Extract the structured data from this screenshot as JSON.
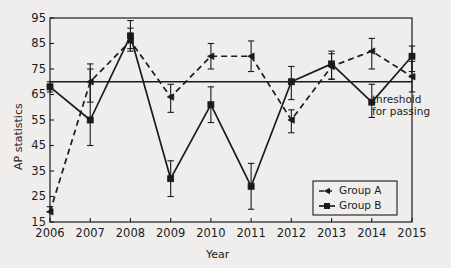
{
  "chart_data": {
    "type": "line",
    "title": "",
    "xlabel": "Year",
    "ylabel": "AP statistics",
    "x": [
      2006,
      2007,
      2008,
      2009,
      2010,
      2011,
      2012,
      2013,
      2014,
      2015
    ],
    "xtick_labels": [
      "2006",
      "2007",
      "2008",
      "2009",
      "2010",
      "2011",
      "2012",
      "2013",
      "2014",
      "2015"
    ],
    "ytick_labels": [
      "15",
      "25",
      "35",
      "45",
      "55",
      "65",
      "75",
      "85",
      "95"
    ],
    "yticks": [
      15,
      25,
      35,
      45,
      55,
      65,
      75,
      85,
      95
    ],
    "ylim": [
      15,
      95
    ],
    "xlim": [
      2006,
      2015
    ],
    "grid": false,
    "legend_position": "lower right",
    "series": [
      {
        "name": "Group A",
        "style": "dashed",
        "marker": "triangle",
        "color": "#1b1b1b",
        "values": [
          19,
          70,
          86,
          64,
          80,
          80,
          55,
          76,
          82,
          72
        ],
        "err_low": [
          19,
          62,
          82,
          58,
          75,
          74,
          50,
          71,
          75,
          66
        ],
        "err_high": [
          21,
          77,
          91,
          69,
          85,
          86,
          59,
          81,
          87,
          78
        ]
      },
      {
        "name": "Group B",
        "style": "solid",
        "marker": "square",
        "color": "#1b1b1b",
        "values": [
          68,
          55,
          88,
          32,
          61,
          29,
          70,
          77,
          62,
          80
        ],
        "err_low": [
          66,
          45,
          83,
          25,
          54,
          20,
          63,
          71,
          56,
          74
        ],
        "err_high": [
          70,
          75,
          94,
          39,
          68,
          38,
          76,
          82,
          69,
          84
        ]
      }
    ],
    "threshold": {
      "value": 70,
      "label_line1": "threshold",
      "label_line2": "for passing"
    }
  }
}
